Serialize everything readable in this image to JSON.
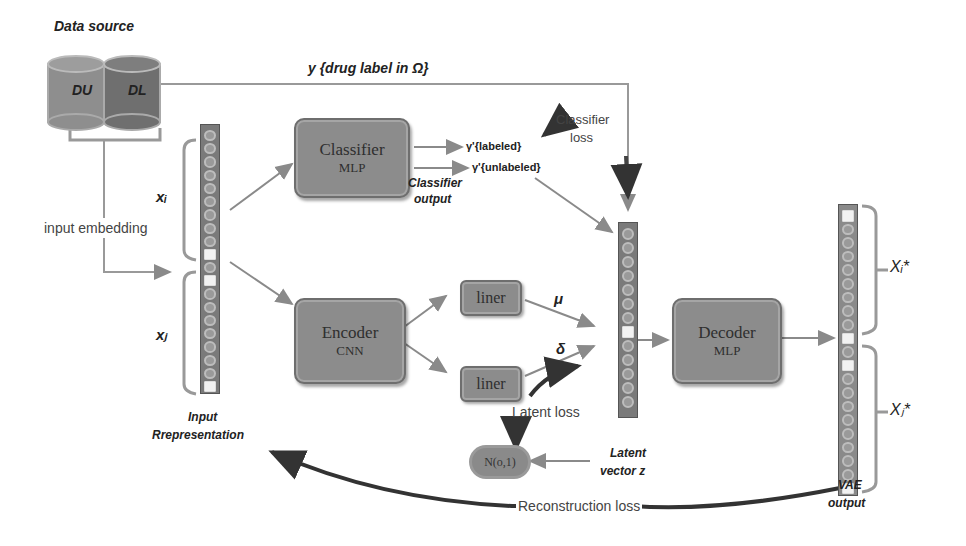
{
  "data_source": {
    "title": "Data source",
    "cylinders": [
      {
        "label": "D_U",
        "display": "DU",
        "color": "#8e8e8e"
      },
      {
        "label": "D_L",
        "display": "DL",
        "color": "#6f6f6f"
      }
    ]
  },
  "labels": {
    "y_label": "y {drug label in  Ω}",
    "input_embedding": "input embedding",
    "x_i": "xᵢ",
    "x_j": "xⱼ",
    "input_repr_line1": "Input",
    "input_repr_line2": "Rrepresentation",
    "classifier_output_line1": "Classifier",
    "classifier_output_line2": "output",
    "y_labeled": "γ'{labeled}",
    "y_unlabeled": "γ'{unlabeled}",
    "classifier_loss_line1": "Classifier",
    "classifier_loss_line2": "loss",
    "mu": "μ",
    "delta": "δ",
    "latent_loss": "Latent loss",
    "normal": "N(o,1)",
    "latent_line1": "Latent",
    "latent_line2": "vector z",
    "x_i_star": "Xᵢ*",
    "x_j_star": "Xⱼ*",
    "vae_line1": "VAE",
    "vae_line2": "output",
    "reconstruction_loss": "Reconstruction loss"
  },
  "blocks": {
    "classifier": {
      "title": "Classifier",
      "sub": "MLP"
    },
    "encoder": {
      "title": "Encoder",
      "sub": "CNN"
    },
    "liner_top": {
      "title": "liner"
    },
    "liner_bottom": {
      "title": "liner"
    },
    "decoder": {
      "title": "Decoder",
      "sub": "MLP"
    }
  },
  "colors": {
    "block_fill": "#8c8c8c",
    "arrow": "#8a8a8a",
    "loss_arrow": "#333333",
    "vector_fill": "#7a7a7a"
  }
}
